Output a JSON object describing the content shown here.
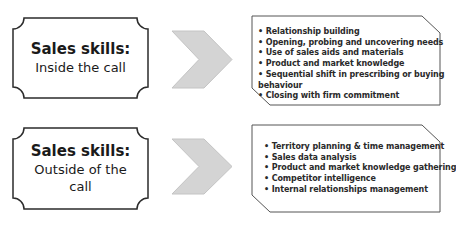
{
  "rows": [
    {
      "title": "Sales skills:",
      "subtitle": "Inside the call",
      "items": [
        "• Relationship building",
        "• Opening, probing and uncovering needs",
        "• Use of sales aids and materials",
        "• Product and market knowledge",
        "• Sequential shift in prescribing or buying",
        "behaviour",
        "• Closing with firm commitment"
      ]
    },
    {
      "title": "Sales skills:",
      "subtitle": "Outside of  the",
      "subtitle2": "call",
      "items": [
        "• Territory planning & time management",
        "• Sales data analysis",
        "• Product and market knowledge gathering",
        "• Competitor intelligence",
        "• Internal relationships management"
      ]
    }
  ],
  "colors": {
    "outline": "#2b2b2b",
    "chevron_fill": "#d4d4d4",
    "chevron_stroke": "#c4c4c4",
    "list_box_stroke": "#555555"
  }
}
